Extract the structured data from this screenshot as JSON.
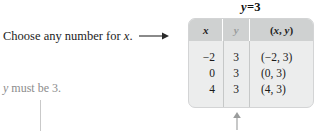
{
  "figure": {
    "equation_caption": "y = 3",
    "equation_variable": "y",
    "equation_operator": "=",
    "equation_value": "3"
  },
  "annotations": {
    "instruction": "Choose any number for x.",
    "instruction_prefix": "Choose any number for ",
    "instruction_variable": "x",
    "instruction_suffix": ".",
    "instruction_arrow_icon": "arrow-right-icon",
    "note_variable": "y",
    "note_text": " must be 3.",
    "bottom_arrow_icon": "arrow-up-icon"
  },
  "table": {
    "columns": [
      {
        "key": "x",
        "label": "x"
      },
      {
        "key": "y",
        "label": "y"
      },
      {
        "key": "xy",
        "label_open": "(",
        "label_x": "x",
        "label_comma": ", ",
        "label_y": "y",
        "label_close": ")"
      }
    ],
    "rows": [
      {
        "x": "−2",
        "y": "3",
        "xy": "(−2, 3)"
      },
      {
        "x": "0",
        "y": "3",
        "xy": "(0, 3)"
      },
      {
        "x": "4",
        "y": "3",
        "xy": "(4, 3)"
      }
    ]
  },
  "colors": {
    "table_body_bg": "#eceded",
    "table_header_bg": "#cfd1d1",
    "table_border": "#d3d4d5",
    "divider": "#c6c8c8",
    "note_gray": "#8c8c8c",
    "text": "#1a1a1a"
  }
}
